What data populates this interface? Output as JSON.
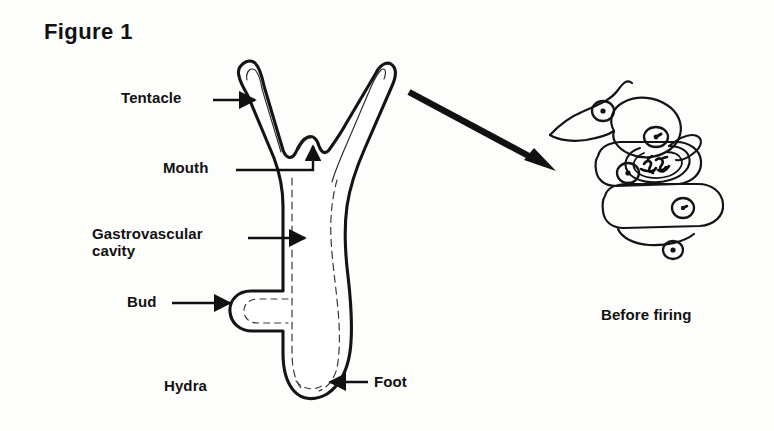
{
  "figure": {
    "title": "Figure 1",
    "background_color": "#fdfdfc",
    "ink_color": "#111111"
  },
  "labels": {
    "tentacle": "Tentacle",
    "mouth": "Mouth",
    "gastrovascular": "Gastrovascular\ncavity",
    "bud": "Bud",
    "hydra": "Hydra",
    "foot": "Foot",
    "before_firing": "Before firing"
  },
  "annotations": [
    {
      "name": "tentacle",
      "text": "Tentacle",
      "leader": "straight-arrow-right",
      "target": "left-tentacle"
    },
    {
      "name": "mouth",
      "text": "Mouth",
      "leader": "elbow-arrow-up",
      "target": "mouth-opening"
    },
    {
      "name": "gastrovascular-cavity",
      "text": "Gastrovascular cavity",
      "leader": "straight-arrow-right",
      "target": "body-cavity"
    },
    {
      "name": "bud",
      "text": "Bud",
      "leader": "straight-arrow-right",
      "target": "bud-outgrowth"
    },
    {
      "name": "hydra",
      "text": "Hydra",
      "leader": "none",
      "target": "whole-organism"
    },
    {
      "name": "foot",
      "text": "Foot",
      "leader": "straight-arrow-left",
      "target": "basal-disc"
    },
    {
      "name": "before-firing",
      "text": "Before firing",
      "leader": "none",
      "target": "nematocyst-detail"
    }
  ],
  "callout": {
    "name": "magnification-arrow",
    "from": "hydra-tentacle-tip",
    "to": "nematocyst-cell-cluster"
  },
  "detail_view": {
    "caption": "Before firing",
    "cell_count": 5,
    "nucleus_count": 5,
    "contains": "coiled-nematocyst-thread"
  }
}
